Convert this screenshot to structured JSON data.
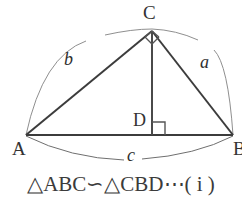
{
  "figure": {
    "type": "geometry-diagram",
    "points": {
      "A": {
        "x": 26,
        "y": 135
      },
      "B": {
        "x": 233,
        "y": 135
      },
      "C": {
        "x": 152,
        "y": 31
      },
      "D": {
        "x": 152,
        "y": 135
      }
    },
    "vertex_labels": [
      {
        "name": "C",
        "text": "C",
        "x": 145,
        "y": 4
      },
      {
        "name": "A",
        "text": "A",
        "x": 12,
        "y": 138
      },
      {
        "name": "B",
        "text": "B",
        "x": 232,
        "y": 138
      },
      {
        "name": "D",
        "text": "D",
        "x": 133,
        "y": 112
      }
    ],
    "side_labels": [
      {
        "name": "b",
        "text": "b",
        "x": 65,
        "y": 52
      },
      {
        "name": "a",
        "text": "a",
        "x": 200,
        "y": 55
      },
      {
        "name": "c",
        "text": "c",
        "x": 127,
        "y": 145
      }
    ],
    "right_angle_marks": [
      {
        "at": "C",
        "style": "rotated-square"
      },
      {
        "at": "D",
        "style": "square"
      }
    ],
    "arcs": [
      {
        "name": "upper-arc",
        "from": "A",
        "to": "B",
        "bulge": "up"
      },
      {
        "name": "lower-arc",
        "from": "A",
        "to": "B",
        "bulge": "down"
      }
    ],
    "colors": {
      "stroke_main": "#3c3c3c",
      "stroke_thin": "#8a8a8a",
      "text": "#333333",
      "background": "#ffffff"
    }
  },
  "caption": {
    "text": "△ABC∽△CBD⋯( i )",
    "similar_symbol": "∽",
    "triangle_symbol": "△",
    "label_tag": "( i )"
  }
}
